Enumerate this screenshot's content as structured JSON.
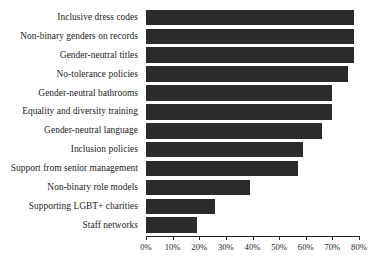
{
  "chart_data": {
    "type": "bar",
    "orientation": "horizontal",
    "title": "",
    "xlabel": "",
    "ylabel": "",
    "xlim": [
      0,
      80
    ],
    "xtick_labels": [
      "0%",
      "10%",
      "20%",
      "30%",
      "40%",
      "50%",
      "60%",
      "70%",
      "80%"
    ],
    "xtick_values": [
      0,
      10,
      20,
      30,
      40,
      50,
      60,
      70,
      80
    ],
    "grid": false,
    "legend": false,
    "bar_color": "#2b2b2b",
    "categories": [
      "Inclusive dress codes",
      "Non-binary genders on records",
      "Gender-neutral titles",
      "No-tolerance policies",
      "Gender-neutral bathrooms",
      "Equality and diversity training",
      "Gender-neutral language",
      "Inclusion policies",
      "Support from senior management",
      "Non-binary role models",
      "Supporting LGBT+ charities",
      "Staff networks"
    ],
    "values": [
      78,
      78,
      78,
      76,
      70,
      70,
      66,
      59,
      57,
      39,
      26,
      19
    ]
  }
}
